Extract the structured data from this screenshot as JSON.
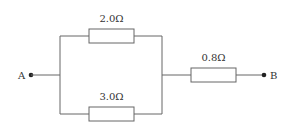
{
  "diagram": {
    "type": "circuit",
    "terminals": [
      {
        "id": "A",
        "label": "A"
      },
      {
        "id": "B",
        "label": "B"
      }
    ],
    "resistors": [
      {
        "id": "R1",
        "label": "2.0Ω",
        "position": "parallel-top"
      },
      {
        "id": "R2",
        "label": "3.0Ω",
        "position": "parallel-bottom"
      },
      {
        "id": "R3",
        "label": "0.8Ω",
        "position": "series"
      }
    ]
  }
}
